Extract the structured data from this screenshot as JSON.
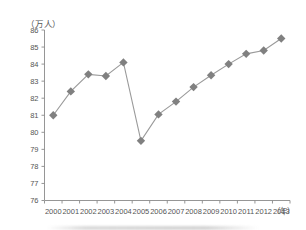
{
  "chart_data": {
    "type": "line",
    "title": "",
    "xlabel": "（年）",
    "ylabel": "（万人）",
    "ylim": [
      76,
      86
    ],
    "ytick_step": 1,
    "yticks": [
      "76",
      "77",
      "78",
      "79",
      "80",
      "81",
      "82",
      "83",
      "84",
      "85",
      "86"
    ],
    "grid": false,
    "legend": "none",
    "marker": "diamond",
    "categories": [
      "2000",
      "2001",
      "2002",
      "2003",
      "2004",
      "2005",
      "2006",
      "2007",
      "2008",
      "2009",
      "2010",
      "2011",
      "2012",
      "2013"
    ],
    "values": [
      81.0,
      82.4,
      83.4,
      83.3,
      84.1,
      79.5,
      81.05,
      81.8,
      82.65,
      83.35,
      84.0,
      84.6,
      84.8,
      85.5
    ],
    "series": [
      {
        "name": "人数",
        "values": [
          81.0,
          82.4,
          83.4,
          83.3,
          84.1,
          79.5,
          81.05,
          81.8,
          82.65,
          83.35,
          84.0,
          84.6,
          84.8,
          85.5
        ]
      }
    ],
    "colors": {
      "marker": "#808080",
      "line": "#9a9a9a",
      "axis": "#8a8a8a",
      "text": "#555555"
    }
  }
}
